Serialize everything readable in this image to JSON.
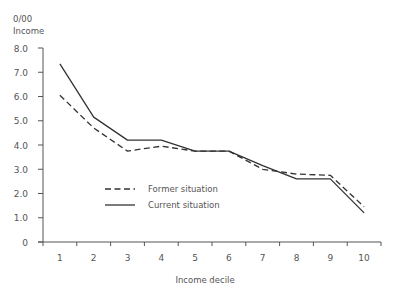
{
  "chart_data": {
    "type": "line",
    "title": "",
    "ylabel_line1": "0/00",
    "ylabel_line2": "Income",
    "xlabel": "Income decile",
    "categories": [
      "1",
      "2",
      "3",
      "4",
      "5",
      "6",
      "7",
      "8",
      "9",
      "10"
    ],
    "yticks": [
      "0",
      "1.0",
      "2.0",
      "3.0",
      "4.0",
      "5.0",
      "6.0",
      "7.0",
      "8.0"
    ],
    "ylim": [
      0,
      8
    ],
    "grid": false,
    "legend_position": "inside-lower-left",
    "series": [
      {
        "name": "Former situation",
        "style": "dashed",
        "color": "#333333",
        "values": [
          6.05,
          4.7,
          3.75,
          3.95,
          3.75,
          3.75,
          3.0,
          2.8,
          2.75,
          1.45
        ]
      },
      {
        "name": "Current situation",
        "style": "solid",
        "color": "#333333",
        "values": [
          7.35,
          5.15,
          4.2,
          4.2,
          3.75,
          3.75,
          3.15,
          2.6,
          2.6,
          1.2
        ]
      }
    ]
  },
  "colors": {
    "axis": "#555555",
    "text": "#555555",
    "line": "#333333",
    "background": "#ffffff"
  }
}
